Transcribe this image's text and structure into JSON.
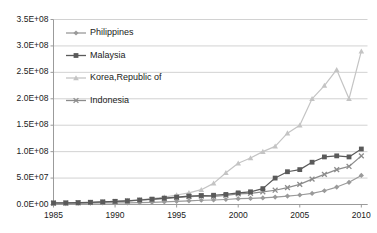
{
  "chart_data": {
    "type": "line",
    "title": "",
    "xlabel": "",
    "ylabel": "",
    "xlim": [
      1985,
      2010.5
    ],
    "ylim": [
      0,
      350000000
    ],
    "grid": true,
    "grid_axis": "y",
    "legend_position": "upper-left-inside",
    "x_ticks": [
      "1985",
      "1990",
      "1995",
      "2000",
      "2005",
      "2010"
    ],
    "x_tick_values": [
      1985,
      1990,
      1995,
      2000,
      2005,
      2010
    ],
    "y_ticks": [
      "0.0E+00",
      "5.0E+07",
      "1.0E+08",
      "1.5E+08",
      "2.0E+08",
      "2.5E+08",
      "3.0E+08",
      "3.5E+08"
    ],
    "y_tick_values": [
      0,
      50000000,
      100000000,
      150000000,
      200000000,
      250000000,
      300000000,
      350000000
    ],
    "series": [
      {
        "name": "Philippines",
        "marker": "diamond",
        "color": "#9a9a9a",
        "x": [
          1985,
          1986,
          1987,
          1988,
          1989,
          1990,
          1991,
          1992,
          1993,
          1994,
          1995,
          1996,
          1997,
          1998,
          1999,
          2000,
          2001,
          2002,
          2003,
          2004,
          2005,
          2006,
          2007,
          2008,
          2009,
          2010
        ],
        "values": [
          1500000,
          1700000,
          2000000,
          2400000,
          2800000,
          3000000,
          3200000,
          3600000,
          4200000,
          5000000,
          6000000,
          7000000,
          8000000,
          8500000,
          9500000,
          11000000,
          11500000,
          12500000,
          14000000,
          16000000,
          18000000,
          21000000,
          26000000,
          33000000,
          42000000,
          55000000
        ]
      },
      {
        "name": "Malaysia",
        "marker": "square",
        "color": "#5a5a5a",
        "x": [
          1985,
          1986,
          1987,
          1988,
          1989,
          1990,
          1991,
          1992,
          1993,
          1994,
          1995,
          1996,
          1997,
          1998,
          1999,
          2000,
          2001,
          2002,
          2003,
          2004,
          2005,
          2006,
          2007,
          2008,
          2009,
          2010
        ],
        "values": [
          3000000,
          3200000,
          3600000,
          4200000,
          5000000,
          6000000,
          7000000,
          8500000,
          10000000,
          12000000,
          14000000,
          16000000,
          17000000,
          17500000,
          19000000,
          22000000,
          24000000,
          30000000,
          50000000,
          62000000,
          66000000,
          80000000,
          90000000,
          92000000,
          90000000,
          105000000
        ]
      },
      {
        "name": "Korea,Republic of",
        "marker": "triangle",
        "color": "#c4c4c4",
        "x": [
          1985,
          1986,
          1987,
          1988,
          1989,
          1990,
          1991,
          1992,
          1993,
          1994,
          1995,
          1996,
          1997,
          1998,
          1999,
          2000,
          2001,
          2002,
          2003,
          2004,
          2005,
          2006,
          2007,
          2008,
          2009,
          2010
        ],
        "values": [
          2000000,
          2500000,
          3000000,
          4000000,
          5000000,
          6000000,
          7500000,
          9000000,
          11000000,
          14000000,
          18000000,
          22000000,
          28000000,
          40000000,
          60000000,
          78000000,
          88000000,
          100000000,
          110000000,
          135000000,
          150000000,
          200000000,
          225000000,
          255000000,
          200000000,
          290000000
        ]
      },
      {
        "name": "Indonesia",
        "marker": "x",
        "color": "#8c8c8c",
        "x": [
          1985,
          1986,
          1987,
          1988,
          1989,
          1990,
          1991,
          1992,
          1993,
          1994,
          1995,
          1996,
          1997,
          1998,
          1999,
          2000,
          2001,
          2002,
          2003,
          2004,
          2005,
          2006,
          2007,
          2008,
          2009,
          2010
        ],
        "values": [
          2500000,
          2800000,
          3200000,
          3800000,
          4500000,
          5500000,
          6500000,
          8000000,
          9500000,
          11000000,
          13000000,
          15000000,
          16000000,
          15500000,
          17000000,
          20000000,
          21000000,
          24000000,
          27000000,
          32000000,
          38000000,
          48000000,
          57000000,
          66000000,
          72000000,
          92000000
        ]
      }
    ]
  },
  "legend": {
    "items": [
      {
        "label": "Philippines"
      },
      {
        "label": "Malaysia"
      },
      {
        "label": "Korea,Republic of"
      },
      {
        "label": "Indonesia"
      }
    ]
  }
}
